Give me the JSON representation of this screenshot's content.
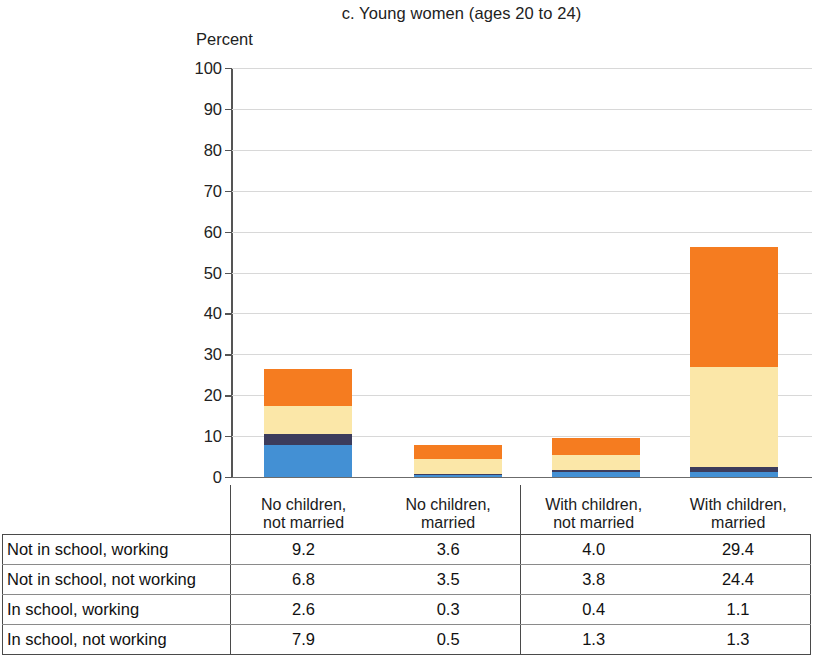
{
  "figure": {
    "title": "c. Young women (ages 20 to 24)",
    "axis_title": "Percent"
  },
  "chart_data": {
    "type": "bar",
    "stacked": true,
    "title": "c. Young women (ages 20 to 24)",
    "xlabel": "",
    "ylabel": "Percent",
    "ylim": [
      0,
      100
    ],
    "yticks": [
      0,
      10,
      20,
      30,
      40,
      50,
      60,
      70,
      80,
      90,
      100
    ],
    "grid": true,
    "legend": "none (values shown in data table below)",
    "categories": [
      "No children, not married",
      "No children, married",
      "With children, not married",
      "With children, married"
    ],
    "series": [
      {
        "name": "Not in school, working",
        "values": [
          9.2,
          3.6,
          4.0,
          29.4
        ],
        "color": "#F57C20"
      },
      {
        "name": "Not in school, not working",
        "values": [
          6.8,
          3.5,
          3.8,
          24.4
        ],
        "color": "#FBE7A8"
      },
      {
        "name": "In school, working",
        "values": [
          2.6,
          0.3,
          0.4,
          1.1
        ],
        "color": "#3C3C5C"
      },
      {
        "name": "In school, not working",
        "values": [
          7.9,
          0.5,
          1.3,
          1.3
        ],
        "color": "#4390D4"
      }
    ],
    "stack_order_bottom_to_top": [
      "In school, not working",
      "In school, working",
      "Not in school, not working",
      "Not in school, working"
    ],
    "bar_totals": [
      26.5,
      7.9,
      9.5,
      56.2
    ]
  },
  "table": {
    "column_headers": [
      "No children,\nnot married",
      "No children,\nmarried",
      "With children,\nnot married",
      "With children,\nmarried"
    ],
    "column_headers_line1": [
      "No children,",
      "No children,",
      "With children,",
      "With children,"
    ],
    "column_headers_line2": [
      "not married",
      "married",
      "not married",
      "married"
    ],
    "rows": [
      {
        "label": "Not in school, working",
        "values": [
          "9.2",
          "3.6",
          "4.0",
          "29.4"
        ]
      },
      {
        "label": "Not in school, not working",
        "values": [
          "6.8",
          "3.5",
          "3.8",
          "24.4"
        ]
      },
      {
        "label": "In school, working",
        "values": [
          "2.6",
          "0.3",
          "0.4",
          "1.1"
        ]
      },
      {
        "label": "In school, not working",
        "values": [
          "7.9",
          "0.5",
          "1.3",
          "1.3"
        ]
      }
    ]
  },
  "colors": {
    "orange": "#F57C20",
    "cream": "#FBE7A8",
    "navy": "#3C3C5C",
    "blue": "#4390D4",
    "gridline": "#d8d8d8",
    "axis": "#555555"
  }
}
